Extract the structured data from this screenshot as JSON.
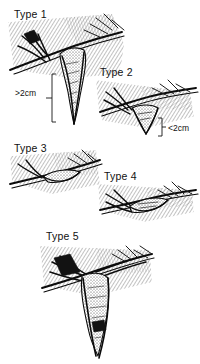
{
  "figure": {
    "kind": "medical-line-illustration",
    "background_color": "#ffffff",
    "ink_color": "#0b0b0b",
    "hatch_color": "#6e6e6e",
    "panel_count": 5
  },
  "panels": [
    {
      "id": "type-1",
      "label": "Type 1",
      "label_x": 14,
      "label_y": 18,
      "annotation": ">2cm",
      "annotation_x": 15,
      "annotation_y": 96,
      "description": "Deep narrow pointed sac projecting far below the tissue plane"
    },
    {
      "id": "type-2",
      "label": "Type 2",
      "label_x": 100,
      "label_y": 76,
      "annotation": "<2cm",
      "annotation_x": 166,
      "annotation_y": 133,
      "description": "Shallow short sac projecting slightly below the tissue plane"
    },
    {
      "id": "type-3",
      "label": "Type 3",
      "label_x": 14,
      "label_y": 152,
      "annotation": "",
      "annotation_x": 0,
      "annotation_y": 0,
      "description": "Flat configuration with no downward projection"
    },
    {
      "id": "type-4",
      "label": "Type 4",
      "label_x": 104,
      "label_y": 180,
      "annotation": "",
      "annotation_x": 0,
      "annotation_y": 0,
      "description": "Flattened lens shaped cavity along the tissue plane"
    },
    {
      "id": "type-5",
      "label": "Type 5",
      "label_x": 46,
      "label_y": 240,
      "annotation": "",
      "annotation_x": 0,
      "annotation_y": 0,
      "description": "Long tubular structure descending well below the tissue plane"
    }
  ]
}
